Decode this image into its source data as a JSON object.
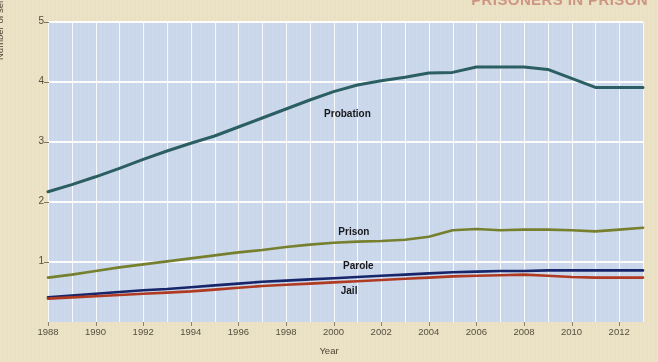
{
  "page": {
    "cut_heading": "Prisoners in Prison",
    "background_color": "#ece2c6",
    "plot_background_color": "#ccd9ec",
    "gridline_color": "#ffffff"
  },
  "chart_data": {
    "type": "line",
    "title": "",
    "xlabel": "Year",
    "ylabel": "Number of sentenced offenders (millions)",
    "xlim": [
      1988,
      2013
    ],
    "ylim": [
      0,
      5
    ],
    "grid": true,
    "legend_position": "inline-annotations",
    "x_tick_labels": [
      "1988",
      "1990",
      "1992",
      "1994",
      "1996",
      "1998",
      "2000",
      "2002",
      "2004",
      "2006",
      "2008",
      "2010",
      "2012"
    ],
    "y_tick_labels": [
      "1",
      "2",
      "3",
      "4",
      "5"
    ],
    "x": [
      1988,
      1989,
      1990,
      1991,
      1992,
      1993,
      1994,
      1995,
      1996,
      1997,
      1998,
      1999,
      2000,
      2001,
      2002,
      2003,
      2004,
      2005,
      2006,
      2007,
      2008,
      2009,
      2010,
      2011,
      2012,
      2013
    ],
    "series": [
      {
        "name": "Probation",
        "color": "#2b5f63",
        "label_x": 1999.6,
        "label_y": 3.46,
        "values": [
          2.17,
          2.29,
          2.42,
          2.56,
          2.71,
          2.85,
          2.98,
          3.1,
          3.25,
          3.4,
          3.55,
          3.7,
          3.84,
          3.95,
          4.02,
          4.08,
          4.15,
          4.16,
          4.25,
          4.25,
          4.25,
          4.21,
          4.06,
          3.91,
          3.91,
          3.91
        ]
      },
      {
        "name": "Prison",
        "color": "#77802e",
        "label_x": 2000.2,
        "label_y": 1.5,
        "values": [
          0.74,
          0.79,
          0.85,
          0.91,
          0.96,
          1.01,
          1.06,
          1.11,
          1.16,
          1.2,
          1.25,
          1.29,
          1.32,
          1.34,
          1.35,
          1.37,
          1.42,
          1.53,
          1.55,
          1.53,
          1.54,
          1.54,
          1.53,
          1.51,
          1.54,
          1.57
        ]
      },
      {
        "name": "Parole",
        "color": "#17256b",
        "label_x": 2000.4,
        "label_y": 0.93,
        "values": [
          0.41,
          0.44,
          0.47,
          0.5,
          0.53,
          0.55,
          0.58,
          0.61,
          0.64,
          0.67,
          0.69,
          0.71,
          0.73,
          0.75,
          0.77,
          0.79,
          0.81,
          0.83,
          0.84,
          0.85,
          0.85,
          0.86,
          0.86,
          0.86,
          0.86,
          0.86
        ]
      },
      {
        "name": "Jail",
        "color": "#b13a22",
        "label_x": 2000.3,
        "label_y": 0.52,
        "values": [
          0.39,
          0.41,
          0.43,
          0.45,
          0.47,
          0.49,
          0.51,
          0.54,
          0.57,
          0.6,
          0.62,
          0.64,
          0.66,
          0.68,
          0.7,
          0.72,
          0.74,
          0.76,
          0.77,
          0.78,
          0.79,
          0.77,
          0.75,
          0.74,
          0.74,
          0.74
        ]
      }
    ]
  }
}
